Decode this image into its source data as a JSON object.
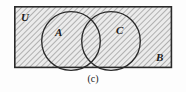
{
  "figure": {
    "kind": "venn-diagram",
    "caption": "(c)",
    "universe_label": "U",
    "complement_label": "B",
    "background_color": "#fdfdfd",
    "shading": {
      "style": "diagonal-hatch",
      "hatch_color": "#9a9a9a",
      "fill_color": "#e8e8e8",
      "description": "entire universal set rectangle is hatched"
    },
    "rectangle": {
      "name": "universal-set-rectangle",
      "x": 14,
      "y": 6,
      "width": 158,
      "height": 62,
      "stroke": "#2a2a2a",
      "stroke_width": 1.6
    },
    "circles": [
      {
        "name": "set-a-circle",
        "label": "A",
        "cx": 71,
        "cy": 41,
        "r": 29.5,
        "stroke": "#2a2a2a",
        "stroke_width": 1.4
      },
      {
        "name": "set-c-circle",
        "label": "C",
        "cx": 111,
        "cy": 41,
        "r": 29.5,
        "stroke": "#2a2a2a",
        "stroke_width": 1.4
      }
    ]
  }
}
